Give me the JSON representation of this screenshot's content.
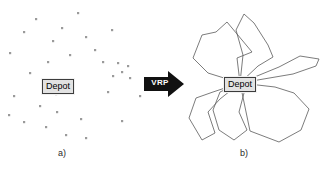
{
  "figure": {
    "background_color": "#ffffff"
  },
  "panel_a": {
    "caption": "a)",
    "depot_label": "Depot",
    "description": "Scattered customer points around a central depot",
    "point_color": "#9a9a9a",
    "points": [
      [
        24,
        32
      ],
      [
        36,
        19
      ],
      [
        53,
        41
      ],
      [
        70,
        55
      ],
      [
        48,
        62
      ],
      [
        10,
        53
      ],
      [
        30,
        73
      ],
      [
        62,
        28
      ],
      [
        86,
        37
      ],
      [
        78,
        13
      ],
      [
        95,
        50
      ],
      [
        112,
        30
      ],
      [
        103,
        62
      ],
      [
        118,
        63
      ],
      [
        128,
        66
      ],
      [
        122,
        72
      ],
      [
        113,
        76
      ],
      [
        130,
        78
      ],
      [
        108,
        92
      ],
      [
        140,
        96
      ],
      [
        14,
        96
      ],
      [
        40,
        106
      ],
      [
        9,
        115
      ],
      [
        24,
        122
      ],
      [
        46,
        127
      ],
      [
        57,
        112
      ],
      [
        66,
        135
      ],
      [
        81,
        119
      ],
      [
        86,
        138
      ],
      [
        122,
        121
      ],
      [
        56,
        94
      ]
    ]
  },
  "arrow": {
    "label": "VRP",
    "color": "#111111",
    "label_color": "#ffffff",
    "direction": "right"
  },
  "panel_b": {
    "caption": "b)",
    "depot_label": "Depot",
    "description": "Six vehicle routes radiating from the depot",
    "route_color": "#5a5a5a",
    "depot_point": [
      60,
      83
    ],
    "routes": [
      {
        "name": "route-northwest",
        "vertices": [
          [
            60,
            83
          ],
          [
            28,
            73
          ],
          [
            13,
            58
          ],
          [
            22,
            35
          ],
          [
            36,
            32
          ],
          [
            47,
            22
          ],
          [
            72,
            52
          ],
          [
            57,
            58
          ],
          [
            60,
            83
          ]
        ]
      },
      {
        "name": "route-north",
        "vertices": [
          [
            60,
            83
          ],
          [
            63,
            55
          ],
          [
            56,
            30
          ],
          [
            64,
            14
          ],
          [
            74,
            23
          ],
          [
            88,
            45
          ],
          [
            93,
            57
          ],
          [
            78,
            66
          ],
          [
            60,
            83
          ]
        ]
      },
      {
        "name": "route-northeast",
        "vertices": [
          [
            60,
            83
          ],
          [
            99,
            67
          ],
          [
            120,
            56
          ],
          [
            139,
            59
          ],
          [
            136,
            66
          ],
          [
            113,
            74
          ],
          [
            60,
            83
          ]
        ]
      },
      {
        "name": "route-east",
        "vertices": [
          [
            60,
            83
          ],
          [
            95,
            87
          ],
          [
            114,
            93
          ],
          [
            129,
            109
          ],
          [
            121,
            130
          ],
          [
            99,
            142
          ],
          [
            70,
            131
          ],
          [
            60,
            83
          ]
        ]
      },
      {
        "name": "route-south",
        "vertices": [
          [
            60,
            83
          ],
          [
            64,
            93
          ],
          [
            59,
            112
          ],
          [
            67,
            130
          ],
          [
            54,
            140
          ],
          [
            39,
            130
          ],
          [
            33,
            110
          ],
          [
            40,
            92
          ],
          [
            60,
            83
          ]
        ]
      },
      {
        "name": "route-southwest",
        "vertices": [
          [
            60,
            83
          ],
          [
            33,
            92
          ],
          [
            16,
            98
          ],
          [
            9,
            118
          ],
          [
            22,
            140
          ],
          [
            35,
            133
          ],
          [
            28,
            112
          ],
          [
            40,
            99
          ],
          [
            60,
            83
          ]
        ]
      }
    ]
  }
}
